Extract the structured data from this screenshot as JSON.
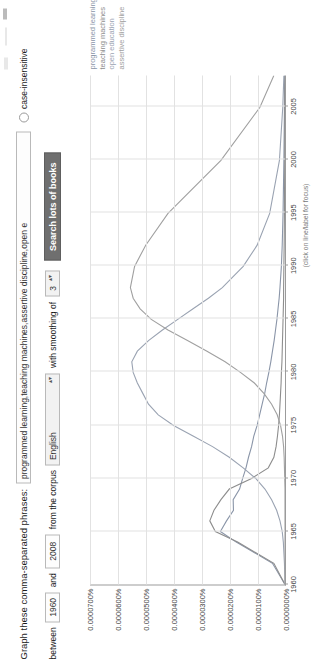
{
  "form": {
    "phrases_label": "Graph these comma-separated phrases:",
    "phrases_value": "programmed learning,teaching machines,assertive discipline,open e",
    "case_insensitive_label": "case-insensitive",
    "between_label": "between",
    "year_start": "1960",
    "and_label": "and",
    "year_end": "2008",
    "corpus_label": "from the corpus",
    "corpus_value": "English",
    "smoothing_label": "with smoothing of",
    "smoothing_value": "3",
    "search_button": "Search lots of books",
    "select_arrows": "▴▾"
  },
  "chart_data": {
    "type": "line",
    "title": "",
    "xlabel": "",
    "ylabel": "",
    "note": "(click on line/label for focus)",
    "xlim": [
      1960,
      2008
    ],
    "ylim": [
      0.0,
      7e-05
    ],
    "grid": true,
    "legend_position": "top-right",
    "xticks": [
      "1960",
      "1965",
      "1970",
      "1975",
      "1980",
      "1985",
      "1990",
      "1995",
      "2000",
      "2005"
    ],
    "yticks": [
      "0.0000700%",
      "0.0000600%",
      "0.0000500%",
      "0.0000400%",
      "0.0000300%",
      "0.0000200%",
      "0.0000100%",
      "0.0000000%"
    ],
    "x": [
      1960,
      1962,
      1964,
      1965,
      1966,
      1967,
      1968,
      1969,
      1970,
      1971,
      1972,
      1973,
      1974,
      1975,
      1976,
      1977,
      1978,
      1979,
      1980,
      1981,
      1982,
      1983,
      1984,
      1985,
      1986,
      1987,
      1988,
      1990,
      1992,
      1995,
      2000,
      2005,
      2008
    ],
    "series": [
      {
        "name": "programmed learning",
        "color": "#8a95a8",
        "values": [
          0.0,
          4.5e-06,
          1.75e-05,
          2.32e-05,
          2.1e-05,
          1.85e-05,
          1.86e-05,
          1.63e-05,
          1.52e-05,
          1.4e-05,
          1.31e-05,
          1.2e-05,
          1.12e-05,
          1e-05,
          9.1e-06,
          8.2e-06,
          7.3e-06,
          6.6e-06,
          5.8e-06,
          5.1e-06,
          4.5e-06,
          3.9e-06,
          3.4e-06,
          2.9e-06,
          2.5e-06,
          2.1e-06,
          1.8e-06,
          1.3e-06,
          1e-06,
          7e-07,
          4e-07,
          2e-07,
          1e-07
        ]
      },
      {
        "name": "teaching machines",
        "color": "#8d8d8d",
        "values": [
          0.0,
          4e-06,
          1.7e-05,
          2.5e-05,
          2.7e-05,
          2.55e-05,
          2.3e-05,
          2e-05,
          1.2e-05,
          6e-06,
          4e-06,
          3.2e-06,
          2.7e-06,
          2.3e-06,
          2e-06,
          1.8e-06,
          1.6e-06,
          1.4e-06,
          1.3e-06,
          1.1e-06,
          1e-06,
          9e-07,
          8e-07,
          7e-07,
          6e-07,
          5e-07,
          5e-07,
          4e-07,
          3e-07,
          2e-07,
          1e-07,
          1e-07,
          0.0
        ]
      },
      {
        "name": "open education",
        "color": "#9aa3b2",
        "values": [
          0.0,
          2e-07,
          6e-07,
          1e-06,
          1.8e-06,
          3e-06,
          4.8e-06,
          7.2e-06,
          1.05e-05,
          1.5e-05,
          2e-05,
          2.6e-05,
          3.3e-05,
          4e-05,
          4.55e-05,
          4.9e-05,
          5.1e-05,
          5.3e-05,
          5.45e-05,
          5.5e-05,
          5.3e-05,
          4.9e-05,
          4.4e-05,
          3.85e-05,
          3.3e-05,
          2.75e-05,
          2.25e-05,
          1.5e-05,
          1e-05,
          5.5e-06,
          2e-06,
          8e-07,
          4e-07
        ]
      },
      {
        "name": "assertive discipline",
        "color": "#a0a0a0",
        "values": [
          0.0,
          0.0,
          0.0,
          0.0,
          0.0,
          0.0,
          0.0,
          0.0,
          1e-07,
          2e-07,
          3e-07,
          5e-07,
          9e-07,
          1.6e-06,
          2.8e-06,
          4.8e-06,
          7.5e-06,
          1.1e-05,
          1.6e-05,
          2.15e-05,
          2.8e-05,
          3.5e-05,
          4.2e-05,
          4.8e-05,
          5.2e-05,
          5.45e-05,
          5.55e-05,
          5.4e-05,
          5e-05,
          4.2e-05,
          2.3e-05,
          9e-06,
          4e-06
        ]
      }
    ]
  }
}
